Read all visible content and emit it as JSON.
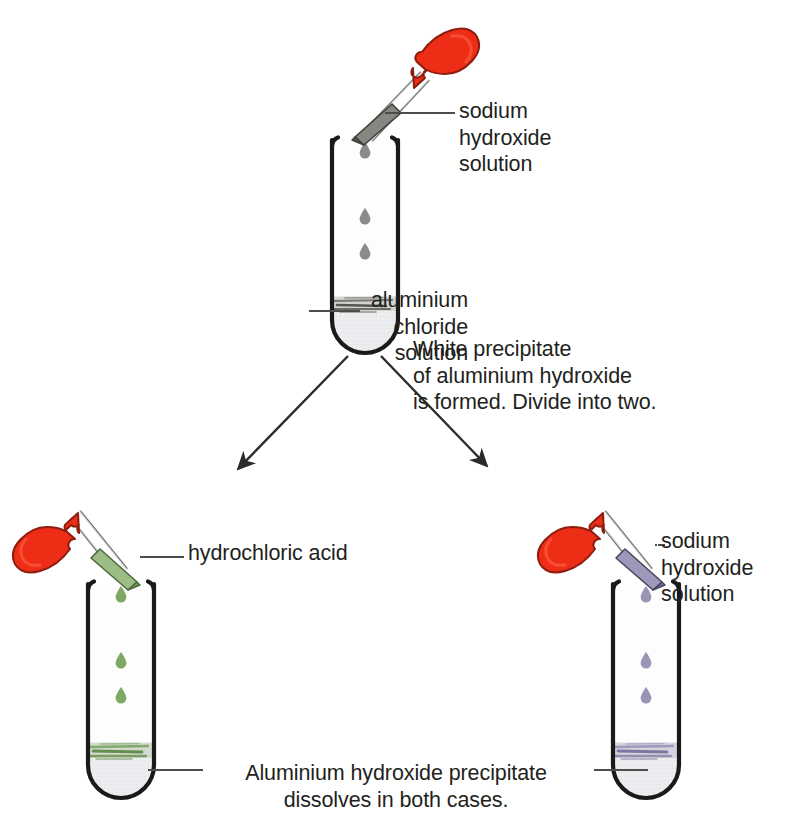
{
  "diagram": {
    "type": "chemistry-test-tube-flow-diagram",
    "background_color": "#ffffff",
    "text_color": "#231f20"
  },
  "labels": {
    "naoh_top": "sodium\nhydroxide\nsolution",
    "aluminium_chloride": "aluminium\nchloride\nsolution",
    "white_precipitate": "White precipitate\nof aluminium hydroxide\nis formed. Divide into two.",
    "hydrochloric_acid": "hydrochloric acid",
    "naoh_bottom": "sodium\nhydroxide\nsolution",
    "bottom_caption": "Aluminium hydroxide precipitate\ndissolves in both cases."
  },
  "tubes": [
    {
      "id": "tube-top",
      "name": "aluminium-chloride-test-tube",
      "contents_label": "aluminium chloride solution",
      "precipitate_color": "#6b6b63",
      "precipitate_label": "white precipitate of aluminium hydroxide",
      "droplet_color": "#8b8b8b",
      "droplet_count": 3
    },
    {
      "id": "tube-bottom-left",
      "name": "hydrochloric-acid-test-tube",
      "contents_label": "aluminium hydroxide precipitate",
      "precipitate_color": "#6f9a5d",
      "precipitate_label": "dissolves in hydrochloric acid",
      "droplet_color": "#7ea863",
      "droplet_count": 3
    },
    {
      "id": "tube-bottom-right",
      "name": "sodium-hydroxide-test-tube",
      "contents_label": "aluminium hydroxide precipitate",
      "precipitate_color": "#8b86a8",
      "precipitate_label": "dissolves in sodium hydroxide",
      "droplet_color": "#9a95b5",
      "droplet_count": 3
    }
  ],
  "droppers": [
    {
      "id": "dropper-top",
      "name": "sodium-hydroxide-dropper",
      "bulb_color": "#ee2d16",
      "tip_color": "#878781",
      "liquid": "sodium hydroxide solution"
    },
    {
      "id": "dropper-bottom-left",
      "name": "hydrochloric-acid-dropper",
      "bulb_color": "#ee2d16",
      "tip_color": "#9dbd86",
      "liquid": "hydrochloric acid"
    },
    {
      "id": "dropper-bottom-right",
      "name": "sodium-hydroxide-dropper-2",
      "bulb_color": "#ee2d16",
      "tip_color": "#9e99bb",
      "liquid": "sodium hydroxide solution"
    }
  ],
  "arrows": [
    {
      "id": "arrow-left",
      "name": "split-arrow-left",
      "from": "tube-top",
      "to": "tube-bottom-left"
    },
    {
      "id": "arrow-right",
      "name": "split-arrow-right",
      "from": "tube-top",
      "to": "tube-bottom-right"
    }
  ],
  "colors": {
    "outline": "#1a1a1a",
    "leader_line": "#4d4d4d",
    "glass_fill": "#fdfdfd",
    "solution_fill": "#eceef0",
    "red_bulb": "#ee2d16",
    "red_bulb_dark": "#c1240f"
  }
}
